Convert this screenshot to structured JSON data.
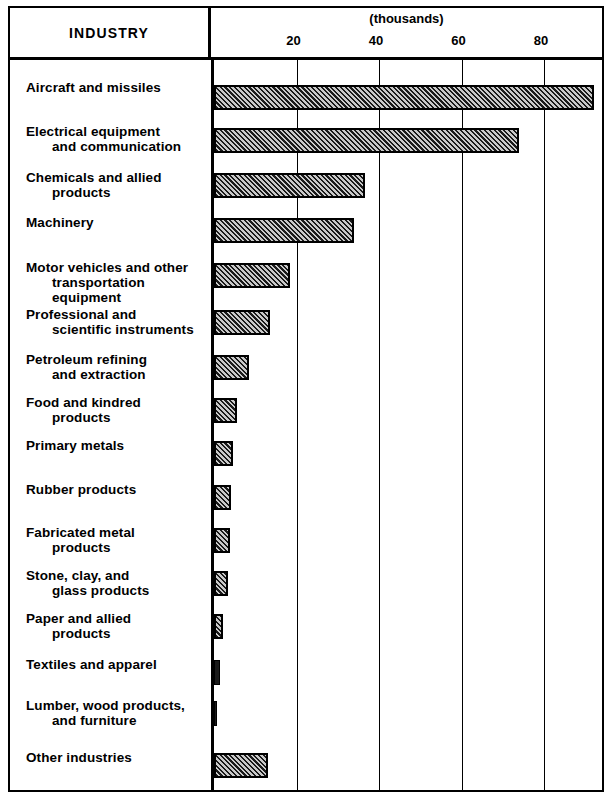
{
  "header": {
    "industry_label": "INDUSTRY",
    "units_label": "(thousands)"
  },
  "chart_data": {
    "type": "bar",
    "orientation": "horizontal",
    "title": "INDUSTRY",
    "xlabel": "(thousands)",
    "ylabel": "INDUSTRY",
    "xlim": [
      0,
      95
    ],
    "grid": true,
    "legend": "none",
    "tick_labels": [
      "20",
      "40",
      "60",
      "80"
    ],
    "ticks": [
      20,
      40,
      60,
      80
    ],
    "categories": [
      "Aircraft and missiles",
      "Electrical equipment and communication",
      "Chemicals and allied products",
      "Machinery",
      "Motor vehicles and other transportation equipment",
      "Professional and scientific instruments",
      "Petroleum refining and extraction",
      "Food and kindred products",
      "Primary metals",
      "Rubber products",
      "Fabricated metal products",
      "Stone, clay, and glass products",
      "Paper and allied products",
      "Textiles and apparel",
      "Lumber, wood products, and furniture",
      "Other industries"
    ],
    "values": [
      92.0,
      74.0,
      36.5,
      34.0,
      18.5,
      13.5,
      8.5,
      5.6,
      4.5,
      4.2,
      3.8,
      3.4,
      2.2,
      1.4,
      0.7,
      13.0
    ]
  },
  "rows": [
    {
      "line1": "Aircraft and missiles",
      "line2": ""
    },
    {
      "line1": "Electrical equipment",
      "line2": "and communication"
    },
    {
      "line1": "Chemicals and allied",
      "line2": "products"
    },
    {
      "line1": "Machinery",
      "line2": ""
    },
    {
      "line1": "Motor vehicles and other",
      "line2": "transportation equipment"
    },
    {
      "line1": "Professional and",
      "line2": "scientific instruments"
    },
    {
      "line1": "Petroleum refining",
      "line2": "and extraction"
    },
    {
      "line1": "Food and kindred",
      "line2": "products"
    },
    {
      "line1": "Primary metals",
      "line2": ""
    },
    {
      "line1": "Rubber products",
      "line2": ""
    },
    {
      "line1": "Fabricated metal",
      "line2": "products"
    },
    {
      "line1": "Stone, clay, and",
      "line2": "glass products"
    },
    {
      "line1": "Paper and allied",
      "line2": "products"
    },
    {
      "line1": "Textiles and apparel",
      "line2": ""
    },
    {
      "line1": "Lumber, wood products,",
      "line2": "and furniture"
    },
    {
      "line1": "Other industries",
      "line2": ""
    }
  ]
}
